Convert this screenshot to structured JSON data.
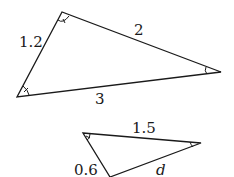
{
  "diagram": {
    "type": "similar-triangles",
    "large_triangle": {
      "vertices": {
        "top": [
          62,
          12
        ],
        "left": [
          17,
          97
        ],
        "right": [
          221,
          72
        ]
      },
      "sides": {
        "left": "1.2",
        "upper": "2",
        "bottom": "3"
      },
      "angle_marks": [
        "single-arc-tick at top",
        "single-arc at right",
        "arc-tick at left"
      ]
    },
    "small_triangle": {
      "vertices": {
        "top_left": [
          83,
          133
        ],
        "right": [
          201,
          143
        ],
        "bottom": [
          110,
          177
        ]
      },
      "sides": {
        "top": "1.5",
        "left": "0.6",
        "lower": "d"
      },
      "angle_marks": [
        "arc-tick at top-left",
        "single-arc at right"
      ]
    },
    "stroke_color": "#1a1a1a"
  }
}
